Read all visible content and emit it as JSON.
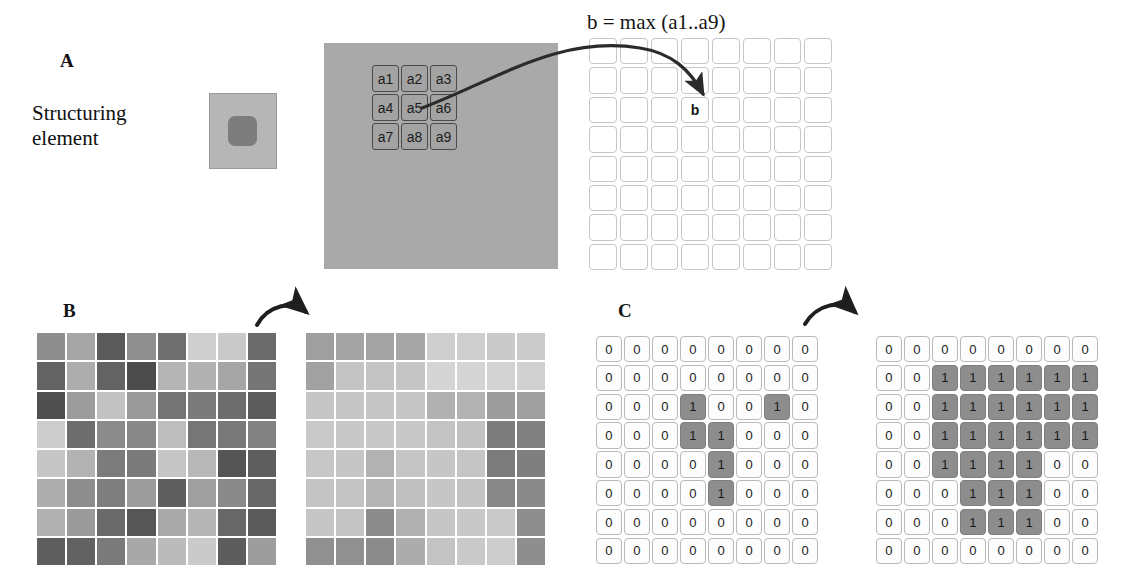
{
  "figure": {
    "panels": [
      {
        "letter": "A"
      },
      {
        "letter": "B"
      },
      {
        "letter": "C"
      }
    ]
  },
  "panel_a": {
    "letter": "A",
    "structuring_element_label_line1": "Structuring",
    "structuring_element_label_line2": "element",
    "formula": "b = max (a1..a9)",
    "neighborhood_labels": [
      "a1",
      "a2",
      "a3",
      "a4",
      "a5",
      "a6",
      "a7",
      "a8",
      "a9"
    ],
    "output_label": "b",
    "output_label_row": 2,
    "output_label_col": 3,
    "source_grid_fill": "#a9a9a9",
    "output_grid_fill": "#ffffff",
    "se_outer_fill": "#b6b6b6",
    "se_inner_fill": "#7d7d7d",
    "grid_rows": 8,
    "grid_cols": 8
  },
  "panel_b": {
    "letter": "B",
    "input_grid": [
      [
        "#8e8e8e",
        "#a5a5a5",
        "#5a5a5a",
        "#8f8f8f",
        "#6f6f6f",
        "#cfcfcf",
        "#c9c9c9",
        "#6b6b6b"
      ],
      [
        "#636363",
        "#adadad",
        "#636363",
        "#4c4c4c",
        "#b4b4b4",
        "#b1b1b1",
        "#a6a6a6",
        "#757575"
      ],
      [
        "#4f4f4f",
        "#9c9c9c",
        "#c2c2c2",
        "#9a9a9a",
        "#747474",
        "#7b7b7b",
        "#6d6d6d",
        "#5c5c5c"
      ],
      [
        "#cccccc",
        "#6d6d6d",
        "#8b8b8b",
        "#888888",
        "#bdbdbd",
        "#767676",
        "#787878",
        "#828282"
      ],
      [
        "#c6c6c6",
        "#b3b3b3",
        "#7c7c7c",
        "#7b7b7b",
        "#c5c5c5",
        "#b8b8b8",
        "#555555",
        "#5e5e5e"
      ],
      [
        "#adadad",
        "#8d8d8d",
        "#7e7e7e",
        "#9d9d9d",
        "#5f5f5f",
        "#9f9f9f",
        "#8a8a8a",
        "#686868"
      ],
      [
        "#b0b0b0",
        "#9b9b9b",
        "#6a6a6a",
        "#565656",
        "#a9a9a9",
        "#b5b5b5",
        "#676767",
        "#5b5b5b"
      ],
      [
        "#5e5e5e",
        "#626262",
        "#7a7a7a",
        "#a8a8a8",
        "#bbbbbb",
        "#cacaca",
        "#5d5d5d",
        "#9d9d9d"
      ]
    ],
    "output_grid": [
      [
        "#9f9f9f",
        "#a4a4a4",
        "#a3a3a3",
        "#a6a6a6",
        "#cfcfcf",
        "#cfcfcf",
        "#cacaca",
        "#cbcbcb"
      ],
      [
        "#a1a1a1",
        "#c4c4c4",
        "#c4c4c4",
        "#c5c5c5",
        "#d4d4d4",
        "#d4d4d4",
        "#d2d2d2",
        "#d1d1d1"
      ],
      [
        "#c5c5c5",
        "#c6c6c6",
        "#c6c6c6",
        "#c6c6c6",
        "#b1b1b1",
        "#b2b2b2",
        "#9d9d9d",
        "#9f9f9f"
      ],
      [
        "#c9c9c9",
        "#c8c8c8",
        "#c8c8c8",
        "#c8c8c8",
        "#c3c3c3",
        "#c2c2c2",
        "#7d7d7d",
        "#808080"
      ],
      [
        "#c7c7c7",
        "#c6c6c6",
        "#b2b2b2",
        "#c5c5c5",
        "#c6c6c6",
        "#c5c5c5",
        "#7c7c7c",
        "#7f7f7f"
      ],
      [
        "#c4c4c4",
        "#c3c3c3",
        "#b4b4b4",
        "#c0c0c0",
        "#c6c6c6",
        "#c4c4c4",
        "#878787",
        "#8a8a8a"
      ],
      [
        "#c6c6c6",
        "#c4c4c4",
        "#8c8c8c",
        "#b0b0b0",
        "#c6c6c6",
        "#c8c8c8",
        "#cacaca",
        "#8d8d8d"
      ],
      [
        "#909090",
        "#909090",
        "#8b8b8b",
        "#acacac",
        "#c3c3c3",
        "#c9c9c9",
        "#cdcdcd",
        "#8e8e8e"
      ]
    ]
  },
  "panel_c": {
    "letter": "C",
    "input_grid": [
      [
        0,
        0,
        0,
        0,
        0,
        0,
        0,
        0
      ],
      [
        0,
        0,
        0,
        0,
        0,
        0,
        0,
        0
      ],
      [
        0,
        0,
        0,
        1,
        0,
        0,
        1,
        0
      ],
      [
        0,
        0,
        0,
        1,
        1,
        0,
        0,
        0
      ],
      [
        0,
        0,
        0,
        0,
        1,
        0,
        0,
        0
      ],
      [
        0,
        0,
        0,
        0,
        1,
        0,
        0,
        0
      ],
      [
        0,
        0,
        0,
        0,
        0,
        0,
        0,
        0
      ],
      [
        0,
        0,
        0,
        0,
        0,
        0,
        0,
        0
      ]
    ],
    "output_grid": [
      [
        0,
        0,
        0,
        0,
        0,
        0,
        0,
        0
      ],
      [
        0,
        0,
        1,
        1,
        1,
        1,
        1,
        1
      ],
      [
        0,
        0,
        1,
        1,
        1,
        1,
        1,
        1
      ],
      [
        0,
        0,
        1,
        1,
        1,
        1,
        1,
        1
      ],
      [
        0,
        0,
        1,
        1,
        1,
        1,
        0,
        0
      ],
      [
        0,
        0,
        0,
        1,
        1,
        1,
        0,
        0
      ],
      [
        0,
        0,
        0,
        1,
        1,
        1,
        0,
        0
      ],
      [
        0,
        0,
        0,
        0,
        0,
        0,
        0,
        0
      ]
    ],
    "zero_fill": "#fdfdfd",
    "one_fill": "#8d8d8d"
  }
}
